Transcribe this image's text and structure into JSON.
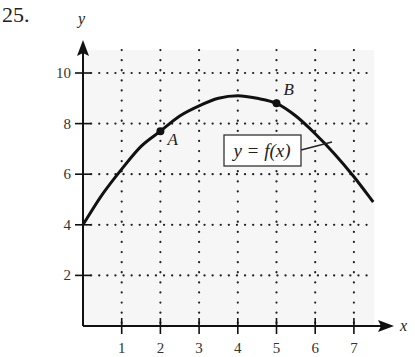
{
  "problem": {
    "number": "25."
  },
  "chart_data": {
    "type": "line",
    "title": "",
    "xlabel": "x",
    "ylabel": "y",
    "xlim": [
      0,
      8
    ],
    "ylim": [
      0,
      11
    ],
    "x_ticks": [
      1,
      2,
      3,
      4,
      5,
      6,
      7
    ],
    "x_tick_labels": [
      "1",
      "2",
      "3",
      "4",
      "5",
      "6",
      "7"
    ],
    "y_ticks": [
      2,
      4,
      6,
      8,
      10
    ],
    "y_tick_labels": [
      "2",
      "4",
      "6",
      "8",
      "10"
    ],
    "grid": "dotted",
    "series": [
      {
        "name": "y = f(x)",
        "x": [
          0,
          0.5,
          1,
          1.5,
          2,
          2.5,
          3,
          3.5,
          4,
          4.5,
          5,
          5.5,
          6,
          6.5,
          7,
          7.5
        ],
        "values": [
          4.0,
          5.2,
          6.2,
          7.1,
          7.7,
          8.3,
          8.7,
          9.0,
          9.1,
          9.0,
          8.8,
          8.3,
          7.6,
          6.8,
          5.9,
          4.9
        ]
      }
    ],
    "points": [
      {
        "label": "A",
        "x": 2,
        "y": 7.7
      },
      {
        "label": "B",
        "x": 5,
        "y": 8.8
      }
    ],
    "annotations": [
      {
        "text": "y = f(x)",
        "boxed": true,
        "points_to_x": 6.4
      }
    ]
  }
}
